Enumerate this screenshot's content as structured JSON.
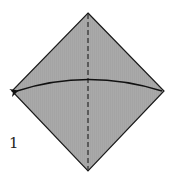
{
  "diagram": {
    "type": "origami-step",
    "step_number": "1",
    "paper": {
      "shape": "square-rotated-45",
      "fill_color": "#a8a8a8",
      "edge_color": "#1a1a1a",
      "vertices": {
        "top": [
          88,
          13
        ],
        "right": [
          164,
          91
        ],
        "bottom": [
          88,
          171
        ],
        "left": [
          12,
          91
        ]
      }
    },
    "valley_fold_line": {
      "style": "dashed",
      "from": [
        88,
        13
      ],
      "to": [
        88,
        171
      ],
      "color": "#333333"
    },
    "fold_arrow": {
      "direction": "right-to-left",
      "from": [
        162,
        91
      ],
      "control": [
        88,
        68
      ],
      "to": [
        16,
        91
      ],
      "color": "#111111"
    }
  }
}
